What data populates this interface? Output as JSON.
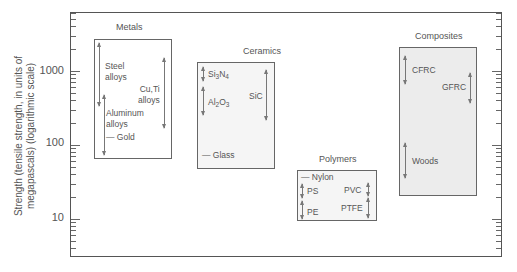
{
  "chart_data": {
    "type": "range-bar (Ashby-style strength chart)",
    "title": "",
    "ylabel": "Strength (tensile strength, in units of megapascals) (logarithmic scale)",
    "yscale": "log",
    "ylim": [
      3,
      7000
    ],
    "yticks": [
      10,
      100,
      1000
    ],
    "ytick_labels": [
      "10",
      "100",
      "1000"
    ],
    "grid": false,
    "categories": [
      "Metals",
      "Ceramics",
      "Polymers",
      "Composites"
    ],
    "groups": [
      {
        "name": "Metals",
        "range": [
          60,
          2800
        ],
        "materials": [
          {
            "name": "Steel alloys",
            "range": [
              300,
              2500
            ]
          },
          {
            "name": "Cu,Ti alloys",
            "range": [
              200,
              1900
            ]
          },
          {
            "name": "Aluminum alloys",
            "range": [
              80,
              700
            ]
          },
          {
            "name": "Gold",
            "value": 130
          }
        ]
      },
      {
        "name": "Ceramics",
        "range": [
          45,
          1300
        ],
        "materials": [
          {
            "name": "Si3N4",
            "range": [
              700,
              1100
            ]
          },
          {
            "name": "Al2O3",
            "range": [
              260,
              650
            ]
          },
          {
            "name": "SiC",
            "range": [
              250,
              1200
            ]
          },
          {
            "name": "Glass",
            "value": 70
          }
        ]
      },
      {
        "name": "Polymers",
        "range": [
          10,
          90
        ],
        "materials": [
          {
            "name": "Nylon",
            "value": 80
          },
          {
            "name": "PS",
            "range": [
              35,
              60
            ]
          },
          {
            "name": "PE",
            "range": [
              10,
              35
            ]
          },
          {
            "name": "PVC",
            "range": [
              40,
              60
            ]
          },
          {
            "name": "PTFE",
            "range": [
              15,
              35
            ]
          }
        ]
      },
      {
        "name": "Composites",
        "range": [
          20,
          2100
        ],
        "materials": [
          {
            "name": "CFRC",
            "range": [
              900,
              2000
            ]
          },
          {
            "name": "GFRC",
            "range": [
              450,
              1300
            ]
          },
          {
            "name": "Woods",
            "range": [
              25,
              110
            ]
          }
        ]
      }
    ]
  },
  "axis": {
    "ylabel": "Strength (tensile strength, in units of megapascals) (logarithmic scale)",
    "ticks": [
      {
        "label": "1000"
      },
      {
        "label": "100"
      },
      {
        "label": "10"
      }
    ]
  },
  "groups": {
    "metals": {
      "title": "Metals",
      "steel": "Steel",
      "steel2": "alloys",
      "cuti": "Cu,Ti",
      "cuti2": "alloys",
      "alum": "Aluminum",
      "alum2": "alloys",
      "gold": "— Gold"
    },
    "ceramics": {
      "title": "Ceramics",
      "si": "Si",
      "si_sub": "3",
      "n": "N",
      "n_sub": "4",
      "al": "Al",
      "al_sub": "2",
      "o": "O",
      "o_sub": "3",
      "sic": "SiC",
      "glass": "— Glass"
    },
    "polymers": {
      "title": "Polymers",
      "nylon": "— Nylon",
      "ps": "PS",
      "pe": "PE",
      "pvc": "PVC",
      "ptfe": "PTFE"
    },
    "composites": {
      "title": "Composites",
      "cfrc": "CFRC",
      "gfrc": "GFRC",
      "woods": "Woods"
    }
  }
}
